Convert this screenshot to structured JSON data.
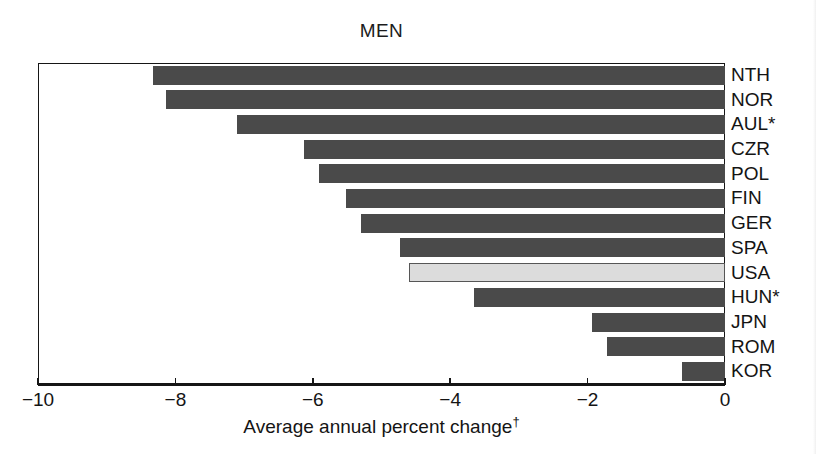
{
  "chart_data": {
    "type": "bar",
    "orientation": "horizontal",
    "title": "MEN",
    "xlabel": "Average annual percent change",
    "xlabel_footnote": "†",
    "ylabel": "",
    "xlim": [
      -10,
      0
    ],
    "xticks": [
      -10,
      -8,
      -6,
      -4,
      -2,
      0
    ],
    "xtick_labels": [
      "−10",
      "−8",
      "−6",
      "−4",
      "−2",
      "0"
    ],
    "grid": false,
    "legend": null,
    "categories": [
      "NTH",
      "NOR",
      "AUL*",
      "CZR",
      "POL",
      "FIN",
      "GER",
      "SPA",
      "USA",
      "HUN*",
      "JPN",
      "ROM",
      "KOR"
    ],
    "values": [
      -8.33,
      -8.14,
      -7.1,
      -6.13,
      -5.91,
      -5.52,
      -5.3,
      -4.73,
      -4.6,
      -3.65,
      -1.94,
      -1.72,
      -0.63
    ],
    "bars": [
      {
        "label": "NTH",
        "value": -8.33,
        "highlight": false
      },
      {
        "label": "NOR",
        "value": -8.14,
        "highlight": false
      },
      {
        "label": "AUL*",
        "value": -7.1,
        "highlight": false
      },
      {
        "label": "CZR",
        "value": -6.13,
        "highlight": false
      },
      {
        "label": "POL",
        "value": -5.91,
        "highlight": false
      },
      {
        "label": "FIN",
        "value": -5.52,
        "highlight": false
      },
      {
        "label": "GER",
        "value": -5.3,
        "highlight": false
      },
      {
        "label": "SPA",
        "value": -4.73,
        "highlight": false
      },
      {
        "label": "USA",
        "value": -4.6,
        "highlight": true
      },
      {
        "label": "HUN*",
        "value": -3.65,
        "highlight": false
      },
      {
        "label": "JPN",
        "value": -1.94,
        "highlight": false
      },
      {
        "label": "ROM",
        "value": -1.72,
        "highlight": false
      },
      {
        "label": "KOR",
        "value": -0.63,
        "highlight": false
      }
    ],
    "colors": {
      "bar": "#4a4a4a",
      "bar_highlight": "#dcdcdc",
      "bar_highlight_border": "#565656",
      "axis": "#161616",
      "text": "#141414",
      "background": "#ffffff"
    }
  }
}
